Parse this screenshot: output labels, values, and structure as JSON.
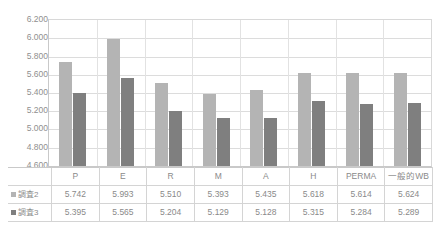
{
  "chart_data": {
    "type": "bar",
    "title": "",
    "subtitle": "",
    "xlabel": "",
    "ylabel": "",
    "categories": [
      "P",
      "E",
      "R",
      "M",
      "A",
      "H",
      "PERMA",
      "一般的WB"
    ],
    "series": [
      {
        "name": "調査2",
        "color": "#b4b4b4",
        "values": [
          5.742,
          5.993,
          5.51,
          5.393,
          5.435,
          5.618,
          5.614,
          5.624
        ],
        "labels": [
          "5.742",
          "5.993",
          "5.510",
          "5.393",
          "5.435",
          "5.618",
          "5.614",
          "5.624"
        ]
      },
      {
        "name": "調査3",
        "color": "#7f7f7f",
        "values": [
          5.395,
          5.565,
          5.204,
          5.129,
          5.128,
          5.315,
          5.284,
          5.289
        ],
        "labels": [
          "5.395",
          "5.565",
          "5.204",
          "5.129",
          "5.128",
          "5.315",
          "5.284",
          "5.289"
        ]
      }
    ],
    "ylim": [
      4.6,
      6.2
    ],
    "ytick_step": 0.2,
    "ytick_labels": [
      "6.200",
      "6.000",
      "5.800",
      "5.600",
      "5.400",
      "5.200",
      "5.000",
      "4.800",
      "4.600"
    ],
    "ytick_values": [
      6.2,
      6.0,
      5.8,
      5.6,
      5.4,
      5.2,
      5.0,
      4.8,
      4.6
    ],
    "grid": true,
    "legend_position": "data-table-left",
    "data_table_visible": true
  },
  "colors": {
    "series_1": "#b4b4b4",
    "series_2": "#7f7f7f",
    "gridline": "#dcdcdc",
    "axis": "#c9c9c9",
    "table_border": "#d4d4d4",
    "text": "#8a8a8a",
    "background": "#ffffff"
  }
}
